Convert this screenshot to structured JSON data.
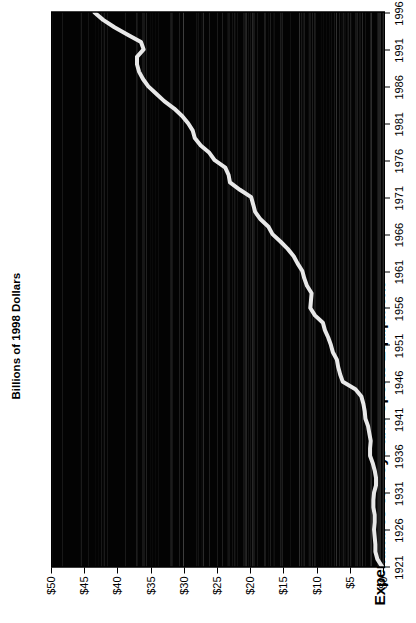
{
  "chart_data": {
    "type": "line",
    "title": "Expenditures on Toys and Sports Equipment",
    "xlabel": "",
    "ylabel": "Billions of 1998 Dollars",
    "orientation": "rotated-90",
    "xlim": [
      1921,
      1996
    ],
    "ylim": [
      0,
      50
    ],
    "grid": false,
    "legend": null,
    "xticklabels": [
      "1921",
      "1926",
      "1931",
      "1936",
      "1941",
      "1946",
      "1951",
      "1956",
      "1961",
      "1966",
      "1971",
      "1976",
      "1981",
      "1986",
      "1991",
      "1996"
    ],
    "xtickvalues": [
      1921,
      1926,
      1931,
      1936,
      1941,
      1946,
      1951,
      1956,
      1961,
      1966,
      1971,
      1976,
      1981,
      1986,
      1991,
      1996
    ],
    "yticklabels": [
      "$0",
      "$5",
      "$10",
      "$15",
      "$20",
      "$25",
      "$30",
      "$35",
      "$40",
      "$45",
      "$50"
    ],
    "ytickvalues": [
      0,
      5,
      10,
      15,
      20,
      25,
      30,
      35,
      40,
      45,
      50
    ],
    "series_name": "Expenditures on Toys and Sports Equipment",
    "line_color": "#e8e8e8",
    "plot_background": "#030303",
    "x": [
      1921,
      1922,
      1923,
      1924,
      1925,
      1926,
      1927,
      1928,
      1929,
      1930,
      1931,
      1932,
      1933,
      1934,
      1935,
      1936,
      1937,
      1938,
      1939,
      1940,
      1941,
      1942,
      1943,
      1944,
      1945,
      1946,
      1947,
      1948,
      1949,
      1950,
      1951,
      1952,
      1953,
      1954,
      1955,
      1956,
      1957,
      1958,
      1959,
      1960,
      1961,
      1962,
      1963,
      1964,
      1965,
      1966,
      1967,
      1968,
      1969,
      1970,
      1971,
      1972,
      1973,
      1974,
      1975,
      1976,
      1977,
      1978,
      1979,
      1980,
      1981,
      1982,
      1983,
      1984,
      1985,
      1986,
      1987,
      1988,
      1989,
      1990,
      1991,
      1992,
      1993,
      1994,
      1995,
      1996
    ],
    "values": [
      0.3,
      1.0,
      1.3,
      1.3,
      1.4,
      1.5,
      1.4,
      1.4,
      1.6,
      1.6,
      1.5,
      1.2,
      1.2,
      1.4,
      1.7,
      2.1,
      2.1,
      2.0,
      2.2,
      2.4,
      2.8,
      2.9,
      3.1,
      3.4,
      4.3,
      6.2,
      6.6,
      6.9,
      7.1,
      7.7,
      8.0,
      8.4,
      8.9,
      9.2,
      10.4,
      11.1,
      11.0,
      10.9,
      11.6,
      12.0,
      12.3,
      13.0,
      13.6,
      14.5,
      15.6,
      16.8,
      17.4,
      18.6,
      19.4,
      19.7,
      20.0,
      21.7,
      23.2,
      23.4,
      23.9,
      25.5,
      26.3,
      27.6,
      28.5,
      28.8,
      29.5,
      30.4,
      31.6,
      33.1,
      34.3,
      35.5,
      36.3,
      36.9,
      37.2,
      37.2,
      36.2,
      36.6,
      38.6,
      40.6,
      42.3,
      43.6
    ]
  },
  "axes": {
    "x_axis_name": "year-axis",
    "y_axis_name": "dollars-axis"
  }
}
